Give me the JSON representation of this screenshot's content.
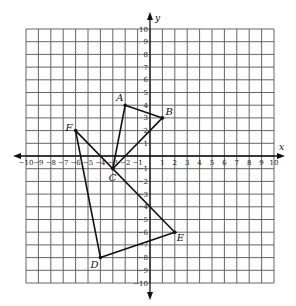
{
  "diagram": {
    "type": "coordinate-plane",
    "axes": {
      "x_label": "x",
      "y_label": "y",
      "x_range": [
        -10,
        10
      ],
      "y_range": [
        -10,
        10
      ],
      "x_ticks": [
        -10,
        -9,
        -8,
        -7,
        -6,
        -5,
        -4,
        -3,
        -2,
        -1,
        1,
        2,
        3,
        4,
        5,
        6,
        7,
        8,
        9,
        10
      ],
      "y_ticks": [
        10,
        9,
        8,
        7,
        6,
        5,
        4,
        3,
        2,
        1,
        -1,
        -2,
        -3,
        -4,
        -5,
        -6,
        -7,
        -8,
        -9,
        -10
      ]
    },
    "points": [
      {
        "name": "A",
        "x": -2,
        "y": 4,
        "label_dx": -9,
        "label_dy": -4
      },
      {
        "name": "B",
        "x": 1,
        "y": 3,
        "label_dx": 3,
        "label_dy": -3
      },
      {
        "name": "C",
        "x": -3,
        "y": -1,
        "label_dx": -4,
        "label_dy": 12
      },
      {
        "name": "D",
        "x": -4,
        "y": -8,
        "label_dx": -10,
        "label_dy": 10
      },
      {
        "name": "E",
        "x": 2,
        "y": -6,
        "label_dx": 2,
        "label_dy": 9
      },
      {
        "name": "F",
        "x": -6,
        "y": 2,
        "label_dx": -10,
        "label_dy": 0
      }
    ],
    "segments": [
      [
        "A",
        "B"
      ],
      [
        "B",
        "C"
      ],
      [
        "C",
        "A"
      ],
      [
        "D",
        "E"
      ],
      [
        "E",
        "F"
      ],
      [
        "F",
        "D"
      ]
    ],
    "shapes": [
      {
        "name": "triangle ABC",
        "vertices": [
          "A",
          "B",
          "C"
        ]
      },
      {
        "name": "triangle DEF",
        "vertices": [
          "D",
          "E",
          "F"
        ]
      }
    ]
  }
}
